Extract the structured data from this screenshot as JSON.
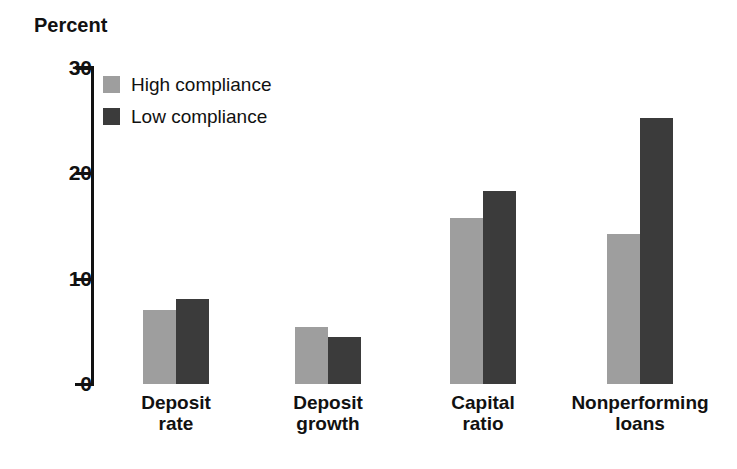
{
  "chart_data": {
    "type": "bar",
    "title": "",
    "ylabel": "Percent",
    "xlabel": "",
    "ylim": [
      0,
      30
    ],
    "yticks": [
      0,
      10,
      20,
      30
    ],
    "ytick_labels": [
      "0",
      "10",
      "20",
      "30"
    ],
    "grid": false,
    "legend_position": "top-left inside plot",
    "categories": [
      "Deposit rate",
      "Deposit growth",
      "Capital ratio",
      "Nonperforming loans"
    ],
    "category_lines": [
      [
        "Deposit",
        "rate"
      ],
      [
        "Deposit",
        "growth"
      ],
      [
        "Capital",
        "ratio"
      ],
      [
        "Nonperforming",
        "loans"
      ]
    ],
    "series": [
      {
        "name": "High compliance",
        "color": "#9e9e9e",
        "values": [
          7.0,
          5.4,
          15.8,
          14.2
        ]
      },
      {
        "name": "Low compliance",
        "color": "#3b3b3b",
        "values": [
          8.1,
          4.5,
          18.3,
          25.3
        ]
      }
    ]
  },
  "axis": {
    "y_title": "Percent"
  },
  "legend": {
    "items": [
      {
        "label": "High compliance",
        "swatch_color": "#9e9e9e"
      },
      {
        "label": "Low compliance",
        "swatch_color": "#3b3b3b"
      }
    ]
  },
  "colors": {
    "high_compliance": "#9e9e9e",
    "low_compliance": "#3b3b3b",
    "axis": "#111111",
    "text": "#111111",
    "background": "#ffffff"
  }
}
